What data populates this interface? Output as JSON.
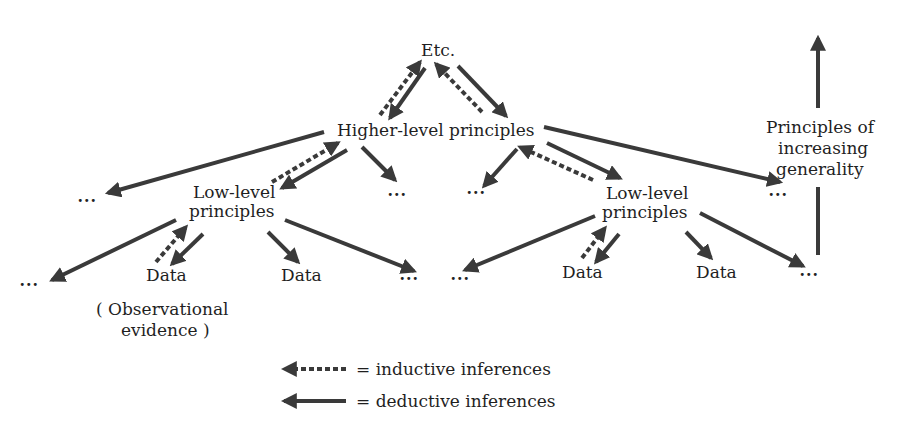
{
  "diagram": {
    "nodes": {
      "top": "Etc.",
      "higher": "Higher-level principles",
      "low_left_1": "Low-level",
      "low_left_2": "principles",
      "low_right_1": "Low-level",
      "low_right_2": "principles",
      "data_1": "Data",
      "data_2": "Data",
      "data_3": "Data",
      "data_4": "Data",
      "observational_1": "( Observational",
      "observational_2": "evidence )",
      "ellipsis": "..."
    },
    "side_label": {
      "line1": "Principles of",
      "line2": "increasing",
      "line3": "generality"
    },
    "legend": {
      "inductive": "= inductive inferences",
      "deductive": "= deductive inferences"
    },
    "colors": {
      "arrow": "#3a3a3a",
      "text": "#1f1f1f",
      "background": "#ffffff"
    }
  }
}
